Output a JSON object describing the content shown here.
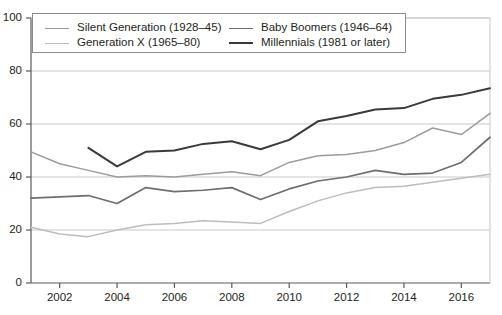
{
  "chart_data": {
    "type": "line",
    "title": "",
    "subtitle": "",
    "xlabel": "",
    "ylabel": "",
    "xlim": [
      2001,
      2017
    ],
    "ylim": [
      0,
      100
    ],
    "grid": true,
    "grid_axis": "y",
    "legend_position": "top-left-inside",
    "x": [
      2001,
      2002,
      2003,
      2004,
      2005,
      2006,
      2007,
      2008,
      2009,
      2010,
      2011,
      2012,
      2013,
      2014,
      2015,
      2016,
      2017
    ],
    "yticks": [
      0,
      20,
      40,
      60,
      80,
      100
    ],
    "ytick_labels": [
      "0",
      "20",
      "40",
      "60",
      "80",
      "100"
    ],
    "xticks": [
      2002,
      2004,
      2006,
      2008,
      2010,
      2012,
      2014,
      2016
    ],
    "xtick_labels": [
      "2002",
      "2004",
      "2006",
      "2008",
      "2010",
      "2012",
      "2014",
      "2016"
    ],
    "series": [
      {
        "name": "Silent Generation (1928–45)",
        "color": "#9c9c9c",
        "width": 1.5,
        "x": [
          2001,
          2002,
          2003,
          2004,
          2005,
          2006,
          2007,
          2008,
          2009,
          2010,
          2011,
          2012,
          2013,
          2014,
          2015,
          2016,
          2017
        ],
        "values": [
          49.5,
          45.0,
          42.5,
          40.0,
          40.5,
          40.0,
          41.0,
          42.0,
          40.5,
          45.5,
          48.0,
          48.5,
          50.0,
          53.0,
          58.5,
          56.0,
          64.0
        ]
      },
      {
        "name": "Generation X (1965–80)",
        "color": "#bdbdbd",
        "width": 1.5,
        "x": [
          2001,
          2002,
          2003,
          2004,
          2005,
          2006,
          2007,
          2008,
          2009,
          2010,
          2011,
          2012,
          2013,
          2014,
          2015,
          2016,
          2017
        ],
        "values": [
          21.0,
          18.5,
          17.5,
          20.0,
          22.0,
          22.5,
          23.5,
          23.0,
          22.5,
          27.0,
          31.0,
          34.0,
          36.0,
          36.5,
          38.0,
          39.5,
          41.0
        ]
      },
      {
        "name": "Baby Boomers (1946–64)",
        "color": "#6e6e6e",
        "width": 1.7,
        "x": [
          2001,
          2002,
          2003,
          2004,
          2005,
          2006,
          2007,
          2008,
          2009,
          2010,
          2011,
          2012,
          2013,
          2014,
          2015,
          2016,
          2017
        ],
        "values": [
          32.0,
          32.5,
          33.0,
          30.0,
          36.0,
          34.5,
          35.0,
          36.0,
          31.5,
          35.5,
          38.5,
          40.0,
          42.5,
          41.0,
          41.5,
          45.5,
          55.0
        ]
      },
      {
        "name": "Millennials (1981 or later)",
        "color": "#3a3a3a",
        "width": 2.0,
        "x": [
          2003,
          2004,
          2005,
          2006,
          2007,
          2008,
          2009,
          2010,
          2011,
          2012,
          2013,
          2014,
          2015,
          2016,
          2017
        ],
        "values": [
          51.0,
          44.0,
          49.5,
          50.0,
          52.5,
          53.5,
          50.5,
          54.0,
          61.0,
          63.0,
          65.5,
          66.0,
          69.5,
          71.0,
          73.5
        ]
      }
    ]
  },
  "legend": {
    "items": [
      {
        "label": "Silent Generation (1928–45)",
        "color": "#9c9c9c"
      },
      {
        "label": "Generation X (1965–80)",
        "color": "#bdbdbd"
      },
      {
        "label": "Baby Boomers (1946–64)",
        "color": "#6e6e6e"
      },
      {
        "label": "Millennials (1981 or later)",
        "color": "#3a3a3a"
      }
    ]
  },
  "axes": {
    "axis_color": "#5a5a5a",
    "grid_color": "#c9c9c9",
    "text_color": "#231f20"
  }
}
